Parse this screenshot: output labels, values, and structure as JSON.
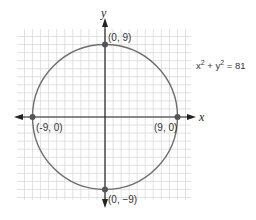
{
  "chart_data": {
    "type": "diagram",
    "title": "",
    "shape": "circle",
    "equation": "x^2 + y^2 = 81",
    "center": [
      0,
      0
    ],
    "radius": 9,
    "axes": {
      "x_label": "x",
      "y_label": "y",
      "grid": true,
      "xlim": [
        -11,
        11
      ],
      "ylim": [
        -10,
        11
      ]
    },
    "points": [
      {
        "x": 0,
        "y": 9,
        "label": "(0, 9)"
      },
      {
        "x": -9,
        "y": 0,
        "label": "(-9, 0)"
      },
      {
        "x": 9,
        "y": 0,
        "label": "(9, 0)"
      },
      {
        "x": 0,
        "y": -9,
        "label": "(0, −9)"
      }
    ]
  },
  "labels": {
    "x_axis": "x",
    "y_axis": "y",
    "equation_main_x": "x",
    "equation_plus": " + ",
    "equation_main_y": "y",
    "equation_exp": "2",
    "equation_rhs": " = 81",
    "point_top": "(0, 9)",
    "point_left": "(-9, 0)",
    "point_right": "(9, 0)",
    "point_bottom": "(0, −9)"
  },
  "colors": {
    "grid": "#d4d4d4",
    "axis": "#222222",
    "circle": "#6e6e6e",
    "point": "#555555"
  }
}
